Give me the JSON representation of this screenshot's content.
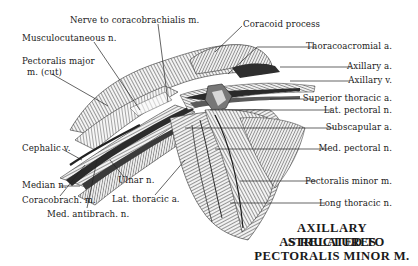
{
  "figure": {
    "title_lines": [
      "AXILLARY STRUCTURES",
      "AS RELATED TO",
      "PECTORALIS MINOR M."
    ],
    "colors": {
      "ink": "#1a1a1a",
      "muscle_shade": "#8a8a8a",
      "dark_vessel": "#3a3a3a",
      "background": "#ffffff"
    }
  },
  "labels": {
    "left": {
      "nerve_to_coracobrachialis": "Nerve to coracobrachialis m.",
      "musculocutaneous": "Musculocutaneous n.",
      "pectoralis_major_1": "Pectoralis major",
      "pectoralis_major_2": "m. (cut)",
      "cephalic": "Cephalic v.",
      "median": "Median n.",
      "coracobrach": "Coracobrach. m.",
      "med_antibrach": "Med. antibrach. n.",
      "ulnar": "Ulnar n.",
      "lat_thoracic": "Lat. thoracic a."
    },
    "top": {
      "coracoid_process": "Coracoid process"
    },
    "right": {
      "thoracoacromial": "Thoracoacromial a.",
      "axillary_a": "Axillary a.",
      "axillary_v": "Axillary v.",
      "superior_thoracic": "Superior thoracic a.",
      "lat_pectoral": "Lat. pectoral n.",
      "subscapular": "Subscapular a.",
      "med_pectoral": "Med. pectoral n.",
      "pectoralis_minor": "Pectoralis minor m.",
      "long_thoracic": "Long thoracic n."
    }
  }
}
